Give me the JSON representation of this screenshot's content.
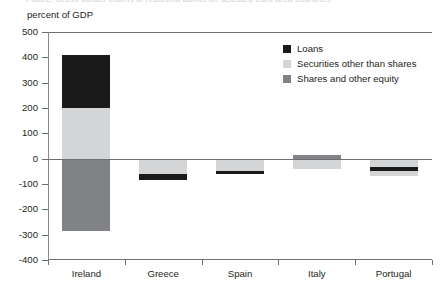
{
  "figure": {
    "unit_label": "percent of GDP",
    "title_remnant": "Figure. Cross-border claims of reporting banks on selected euro area countries"
  },
  "legend": {
    "position": "top-right",
    "items": [
      {
        "label": "Loans",
        "color": "#1a1a1a",
        "key": "loans"
      },
      {
        "label": "Securities other than shares",
        "color": "#d4d5d6",
        "key": "securities"
      },
      {
        "label": "Shares and other equity",
        "color": "#808285",
        "key": "shares"
      }
    ]
  },
  "axes": {
    "y_ticks": [
      "500",
      "400",
      "300",
      "200",
      "100",
      "0",
      "-100",
      "-200",
      "-300",
      "-400"
    ],
    "y_tick_values": [
      500,
      400,
      300,
      200,
      100,
      0,
      -100,
      -200,
      -300,
      -400
    ],
    "x_ticks": [
      "Ireland",
      "Greece",
      "Spain",
      "Italy",
      "Portugal"
    ]
  },
  "chart_data": {
    "type": "bar",
    "subtype": "stacked-diverging",
    "title": "",
    "xlabel": "",
    "ylabel": "percent of GDP",
    "ylim": [
      -400,
      500
    ],
    "grid": false,
    "legend_position": "top-right",
    "categories": [
      "Ireland",
      "Greece",
      "Spain",
      "Italy",
      "Portugal"
    ],
    "series": [
      {
        "name": "Loans",
        "color": "#1a1a1a",
        "values": [
          210,
          -21,
          -12,
          0,
          -15
        ]
      },
      {
        "name": "Securities other than shares",
        "color": "#d4d5d6",
        "values": [
          200,
          -62,
          -48,
          -42,
          -52
        ]
      },
      {
        "name": "Shares and other equity",
        "color": "#808285",
        "values": [
          -285,
          0,
          0,
          15,
          0
        ]
      }
    ],
    "stack_segments": {
      "Ireland": [
        {
          "series": "Shares and other equity",
          "from": 0,
          "to": -285,
          "color": "#808285"
        },
        {
          "series": "Securities other than shares",
          "from": 0,
          "to": 200,
          "color": "#d4d5d6"
        },
        {
          "series": "Loans",
          "from": 200,
          "to": 410,
          "color": "#1a1a1a"
        }
      ],
      "Greece": [
        {
          "series": "Securities other than shares",
          "from": 0,
          "to": -62,
          "color": "#d4d5d6"
        },
        {
          "series": "Loans",
          "from": -62,
          "to": -83,
          "color": "#1a1a1a"
        }
      ],
      "Spain": [
        {
          "series": "Securities other than shares",
          "from": 0,
          "to": -48,
          "color": "#d4d5d6"
        },
        {
          "series": "Loans",
          "from": -48,
          "to": -60,
          "color": "#1a1a1a"
        }
      ],
      "Italy": [
        {
          "series": "Shares and other equity",
          "from": 0,
          "to": 15,
          "color": "#808285"
        },
        {
          "series": "Securities other than shares",
          "from": 0,
          "to": -42,
          "color": "#d4d5d6"
        }
      ],
      "Portugal": [
        {
          "series": "Securities other than shares",
          "from": 0,
          "to": -67,
          "color": "#d4d5d6"
        },
        {
          "series": "Loans",
          "from": -32,
          "to": -47,
          "color": "#1a1a1a"
        }
      ]
    },
    "totals": {
      "Ireland": 125,
      "Greece": -83,
      "Spain": -60,
      "Italy": -27,
      "Portugal": -67
    }
  },
  "colors": {
    "axis": "#6d6e71",
    "text": "#231f20",
    "background": "#ffffff"
  }
}
